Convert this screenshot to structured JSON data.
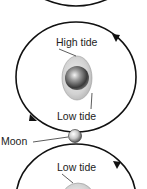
{
  "diagram": {
    "labels": {
      "high_tide": "High tide",
      "low_tide_upper": "Low tide",
      "moon": "Moon",
      "low_tide_lower": "Low tide"
    },
    "colors": {
      "orbit": "#111111",
      "bulge": "#d9d9d9",
      "earth_dark": "#3a3a3a",
      "earth_light": "#f2f2f2",
      "text": "#222222"
    },
    "orbit_direction": "counter-clockwise"
  }
}
